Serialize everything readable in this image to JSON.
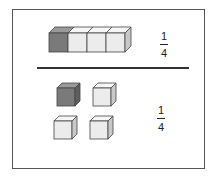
{
  "diagram": {
    "top": {
      "description": "row of 4 joined cubes, 1 shaded",
      "total_cubes": 4,
      "shaded_cubes": 1,
      "fraction": {
        "numerator": "1",
        "denominator": "4"
      }
    },
    "bottom": {
      "description": "4 separate cubes in 2x2 grid, 1 shaded",
      "total_cubes": 4,
      "shaded_cubes": 1,
      "fraction": {
        "numerator": "1",
        "denominator": "4"
      }
    },
    "colors": {
      "shaded_face": "#7a7a7a",
      "shaded_top": "#9a9a9a",
      "shaded_side": "#5e5e5e",
      "light_face": "#ececec",
      "light_top": "#f6f6f6",
      "light_side": "#c8c8c8",
      "outline": "#444444"
    }
  }
}
